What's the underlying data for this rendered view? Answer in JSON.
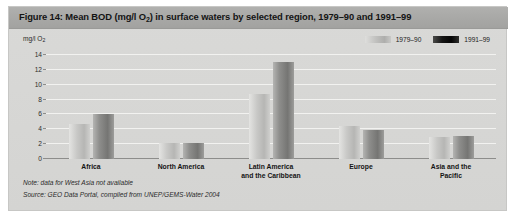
{
  "figure": {
    "title_prefix": "Figure 14: Mean BOD (mg/l O",
    "title_sub": "2",
    "title_suffix": ") in surface waters by selected region, 1979–90 and 1991–99",
    "title_full": "Figure 14: Mean BOD (mg/l O2) in surface waters by selected region, 1979–90 and 1991–99"
  },
  "axis": {
    "unit_prefix": "mg/l O",
    "unit_sub": "2",
    "unit_label": "mg/l O2"
  },
  "legend": {
    "items": [
      {
        "label": "1979–90",
        "color": "#c2c2c0",
        "series_key": "s1"
      },
      {
        "label": "1991–99",
        "color": "#0a0a0a",
        "series_key": "s2"
      }
    ]
  },
  "footnotes": [
    "Note: data for West Asia not available",
    "Source: GEO Data Portal, compiled from UNEP/GEMS-Water 2004"
  ],
  "colors": {
    "card_background": "#d6d6d4",
    "title_bar": "#a8a8a6",
    "plot_background": "#e9e9e7",
    "gridline": "#f2f2f0",
    "axis_line": "#8d8d8b",
    "series_1979_90": "#c2c2c0",
    "series_1991_99": "#0a0a0a"
  },
  "chart_data": {
    "type": "bar",
    "title": "Figure 14: Mean BOD (mg/l O2) in surface waters by selected region, 1979–90 and 1991–99",
    "xlabel": "",
    "ylabel": "mg/l O2",
    "ylim": [
      0,
      14
    ],
    "yticks": [
      0,
      2,
      4,
      6,
      8,
      10,
      12,
      14
    ],
    "grid": true,
    "legend_position": "top-right",
    "categories": [
      "Africa",
      "North America",
      "Latin America\nand the Caribbean",
      "Europe",
      "Asia and the\nPacific"
    ],
    "series": [
      {
        "name": "1979–90",
        "values": [
          4.7,
          2.2,
          8.7,
          4.5,
          3.0
        ]
      },
      {
        "name": "1991–99",
        "values": [
          6.0,
          2.1,
          13.0,
          3.9,
          3.1
        ]
      }
    ]
  }
}
